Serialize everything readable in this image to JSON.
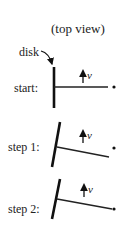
{
  "title": "(top view)",
  "disk_label": "disk",
  "velocity_symbol": "v",
  "colors": {
    "ink": "#222222",
    "background": "#ffffff"
  },
  "rows": [
    {
      "label": "start:",
      "disk": {
        "x1": 54,
        "y1": 67,
        "x2": 54,
        "y2": 108
      },
      "rod": {
        "x1": 54,
        "y1": 87,
        "x2": 108,
        "y2": 87
      },
      "dot": {
        "cx": 114,
        "cy": 87
      },
      "arrow": {
        "x": 83,
        "y_tail": 83,
        "y_head": 71
      }
    },
    {
      "label": "step 1:",
      "disk": {
        "x1": 60,
        "y1": 122,
        "x2": 52,
        "y2": 167
      },
      "rod": {
        "x1": 57,
        "y1": 147,
        "x2": 109,
        "y2": 157
      },
      "dot": {
        "cx": 114,
        "cy": 148
      },
      "arrow": {
        "x": 83,
        "y_tail": 143,
        "y_head": 131
      }
    },
    {
      "label": "step 2:",
      "disk": {
        "x1": 60,
        "y1": 179,
        "x2": 52,
        "y2": 219
      },
      "rod": {
        "x1": 57,
        "y1": 199,
        "x2": 112,
        "y2": 209
      },
      "dot": {
        "cx": 114,
        "cy": 209
      },
      "arrow": {
        "x": 84,
        "y_tail": 197,
        "y_head": 185
      }
    }
  ]
}
